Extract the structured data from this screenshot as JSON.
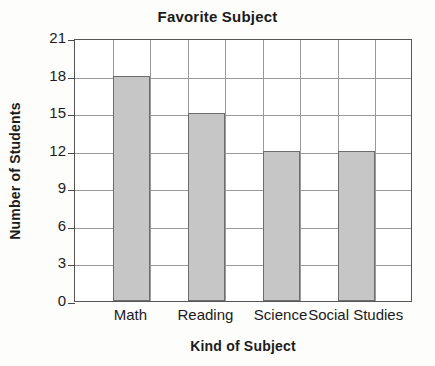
{
  "chart_data": {
    "type": "bar",
    "title": "Favorite Subject",
    "xlabel": "Kind of Subject",
    "ylabel": "Number of Students",
    "categories": [
      "Math",
      "Reading",
      "Science",
      "Social Studies"
    ],
    "values": [
      18,
      15,
      12,
      12
    ],
    "yticks": [
      0,
      3,
      6,
      9,
      12,
      15,
      18,
      21
    ],
    "ylim": [
      0,
      21
    ],
    "ytick_labels": [
      "0",
      "3",
      "6",
      "9",
      "12",
      "15",
      "18",
      "21"
    ],
    "grid": "both",
    "legend": "none",
    "colors": {
      "bar_fill": "#c6c6c6",
      "bar_stroke": "#6d6d6d",
      "grid": "#9a9a9a",
      "axis": "#565656",
      "text": "#1b1b1b",
      "background": "#fdfdfc",
      "plot_background": "#ffffff"
    },
    "columns": 9,
    "bar_columns": [
      1,
      3,
      5,
      7
    ]
  }
}
